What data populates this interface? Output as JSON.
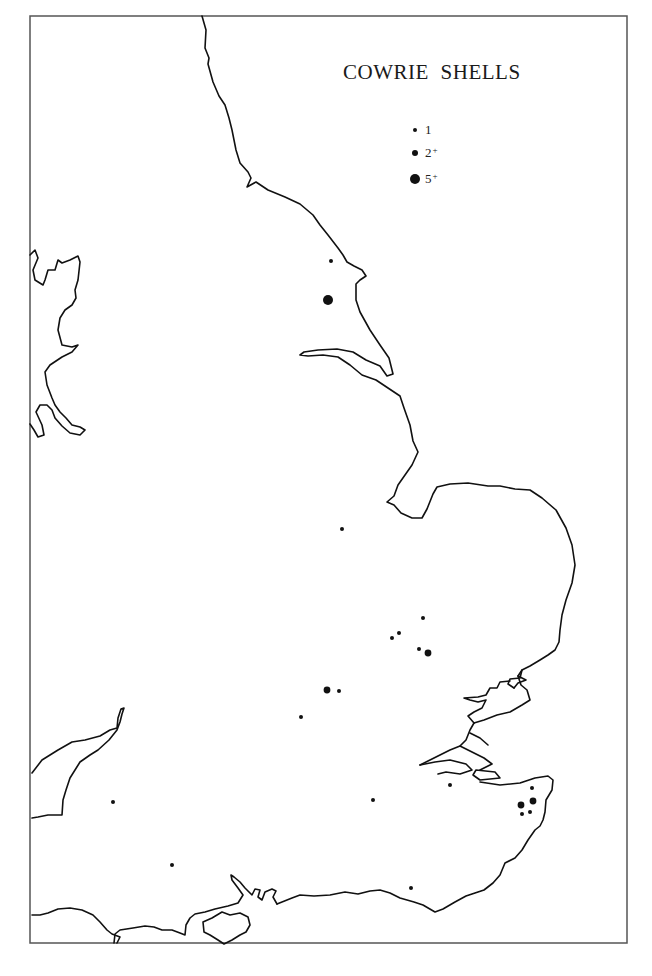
{
  "map": {
    "title": "COWRIE SHELLS",
    "legend": [
      {
        "symbol": "small-dot",
        "label": "1",
        "suffix": "",
        "radius": 2
      },
      {
        "symbol": "medium-dot",
        "label": "2",
        "suffix": "+",
        "radius": 3.2
      },
      {
        "symbol": "large-dot",
        "label": "5",
        "suffix": "+",
        "radius": 5
      }
    ],
    "colors": {
      "ink": "#111111",
      "background": "#ffffff",
      "frame": "#555555"
    },
    "sites": [
      {
        "x": 331,
        "y": 261,
        "size": "small"
      },
      {
        "x": 328,
        "y": 300,
        "size": "large"
      },
      {
        "x": 342,
        "y": 529,
        "size": "small"
      },
      {
        "x": 423,
        "y": 618,
        "size": "small"
      },
      {
        "x": 399,
        "y": 633,
        "size": "small"
      },
      {
        "x": 392,
        "y": 638,
        "size": "small"
      },
      {
        "x": 419,
        "y": 649,
        "size": "small"
      },
      {
        "x": 428,
        "y": 653,
        "size": "medium"
      },
      {
        "x": 327,
        "y": 690,
        "size": "medium"
      },
      {
        "x": 339,
        "y": 691,
        "size": "small"
      },
      {
        "x": 301,
        "y": 717,
        "size": "small"
      },
      {
        "x": 450,
        "y": 785,
        "size": "small"
      },
      {
        "x": 532,
        "y": 788,
        "size": "small"
      },
      {
        "x": 533,
        "y": 801,
        "size": "medium"
      },
      {
        "x": 521,
        "y": 805,
        "size": "medium"
      },
      {
        "x": 522,
        "y": 814,
        "size": "small"
      },
      {
        "x": 530,
        "y": 812,
        "size": "small"
      },
      {
        "x": 373,
        "y": 800,
        "size": "small"
      },
      {
        "x": 113,
        "y": 802,
        "size": "small"
      },
      {
        "x": 172,
        "y": 865,
        "size": "small"
      },
      {
        "x": 411,
        "y": 888,
        "size": "small"
      }
    ]
  }
}
